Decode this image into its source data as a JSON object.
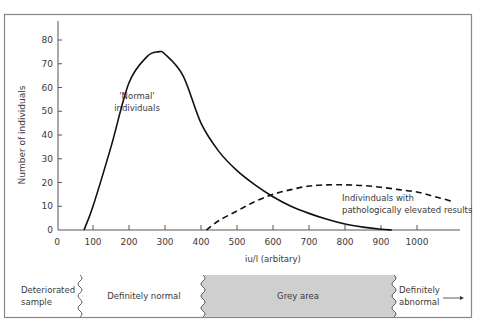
{
  "chart_data": {
    "type": "line",
    "title": "",
    "xlabel": "iu/l (arbitary)",
    "ylabel": "Number of individuals",
    "xlim": [
      0,
      1100
    ],
    "ylim": [
      0,
      88
    ],
    "x_ticks": [
      0,
      100,
      200,
      300,
      400,
      500,
      600,
      700,
      800,
      900,
      1000
    ],
    "y_ticks": [
      0,
      10,
      20,
      30,
      40,
      50,
      60,
      70,
      80
    ],
    "grid": false,
    "series": [
      {
        "name": "'Normal' individuals",
        "style": "solid",
        "x": [
          75,
          100,
          150,
          200,
          250,
          280,
          300,
          350,
          400,
          450,
          500,
          550,
          600,
          650,
          700,
          750,
          800,
          850,
          900,
          930
        ],
        "y": [
          0,
          10,
          35,
          62,
          73,
          75,
          74,
          65,
          45,
          33,
          25,
          19,
          14,
          10,
          7,
          4.5,
          2.5,
          1.2,
          0.3,
          0
        ]
      },
      {
        "name": "Individinuals with pathologically elevated results",
        "style": "dashed",
        "x": [
          415,
          450,
          500,
          550,
          600,
          650,
          700,
          750,
          800,
          850,
          900,
          950,
          1000,
          1050,
          1100
        ],
        "y": [
          0,
          4,
          8,
          12,
          15,
          17,
          18.5,
          19,
          19,
          18.7,
          18,
          17,
          16,
          14,
          12
        ]
      }
    ],
    "annotations": [
      {
        "text_lines": [
          "'Normal'",
          "individuals"
        ],
        "x": 290,
        "y": 58
      },
      {
        "text_lines": [
          "Indivinduals with",
          "pathologically elevated results"
        ],
        "x": 720,
        "y": 10
      }
    ]
  },
  "band": {
    "segments": [
      {
        "label_lines": [
          "Deteriorated",
          "sample"
        ]
      },
      {
        "label_lines": [
          "Definitely normal"
        ]
      },
      {
        "label_lines": [
          "Grey area"
        ]
      },
      {
        "label_lines": [
          "Definitely",
          "abnormal"
        ]
      }
    ],
    "grey_color": "#cfcfcf"
  }
}
